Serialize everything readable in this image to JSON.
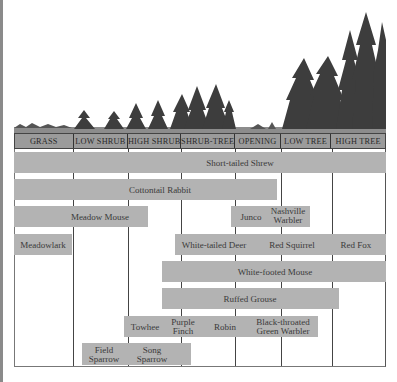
{
  "diagram": {
    "type": "habitat-range-diagram",
    "header": {
      "columns": [
        "GRASS",
        "LOW SHRUB",
        "HIGH SHRUB",
        "SHRUB-TREE",
        "OPENING",
        "LOW TREE",
        "HIGH TREE"
      ]
    },
    "species": {
      "short_tailed_shrew": "Short-tailed Shrew",
      "cottontail_rabbit": "Cottontail Rabbit",
      "meadow_mouse": "Meadow Mouse",
      "junco": "Junco",
      "nashville_warbler_1": "Nashville",
      "nashville_warbler_2": "Warbler",
      "meadowlark": "Meadowlark",
      "white_tailed_deer": "White-tailed Deer",
      "red_squirrel": "Red Squirrel",
      "red_fox": "Red Fox",
      "white_footed_mouse": "White-footed Mouse",
      "ruffed_grouse": "Ruffed Grouse",
      "towhee": "Towhee",
      "purple_finch_1": "Purple",
      "purple_finch_2": "Finch",
      "robin": "Robin",
      "btg_warbler_1": "Black-throated",
      "btg_warbler_2": "Green Warbler",
      "field_sparrow_1": "Field",
      "field_sparrow_2": "Sparrow",
      "song_sparrow_1": "Song",
      "song_sparrow_2": "Sparrow"
    },
    "colors": {
      "bar": "#b3b3b3",
      "header": "#9b9b9b",
      "tree": "#3c3c3c"
    }
  }
}
